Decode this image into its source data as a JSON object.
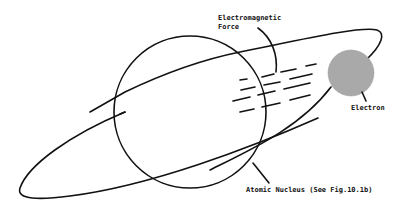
{
  "diagram": {
    "labels": {
      "force_line1": "Electromagnetic",
      "force_line2": "Force",
      "electron": "Electron",
      "nucleus": "Atomic Nucleus (See Fig.10.1b)"
    },
    "colors": {
      "line": "#111111",
      "electron_fill": "#a9a9a9",
      "background": "#ffffff"
    },
    "elements": [
      {
        "id": "nucleus",
        "kind": "circle",
        "label_ref": "nucleus"
      },
      {
        "id": "electron",
        "kind": "filled-circle",
        "label_ref": "electron"
      },
      {
        "id": "orbit",
        "kind": "ellipse-path"
      },
      {
        "id": "force-lines",
        "kind": "dashed-lines",
        "count": 4,
        "label_ref": "force_line1"
      }
    ]
  }
}
